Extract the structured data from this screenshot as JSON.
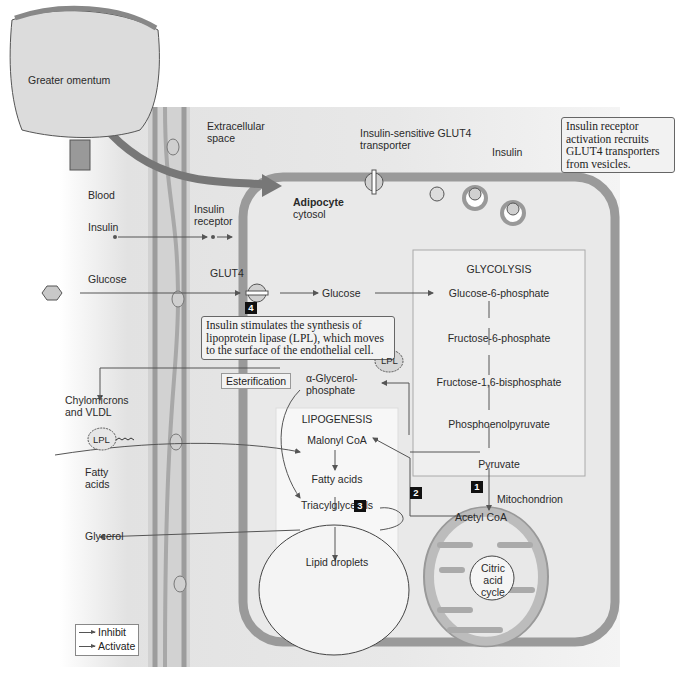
{
  "regions": {
    "organ": "Greater omentum",
    "extracellular": "Extracellular space",
    "blood": "Blood",
    "cell_title": "Adipocyte",
    "cell_subtitle": "cytosol",
    "mitochondrion": "Mitochondrion"
  },
  "blood_side": {
    "insulin": "Insulin",
    "glucose": "Glucose",
    "chylomicrons": "Chylomicrons and VLDL",
    "fatty_acids": "Fatty acids",
    "glycerol": "Glycerol",
    "lpl_outside": "LPL"
  },
  "membrane": {
    "insulin_receptor": "Insulin receptor",
    "glut4": "GLUT4",
    "glut4_sensitive": "Insulin-sensitive GLUT4 transporter",
    "insulin_top": "Insulin",
    "glucose_inside": "Glucose"
  },
  "callouts": {
    "recruit": "Insulin receptor activation recruits GLUT4 transporters from vesicles.",
    "lpl_synthesis": "Insulin stimulates the synthesis of lipoprotein lipase (LPL), which moves to the surface of the endothelial cell.",
    "lpl_inside": "LPL",
    "esterification": "Esterification"
  },
  "glycolysis": {
    "title": "GLYCOLYSIS",
    "steps": [
      "Glucose-6-phosphate",
      "Fructose-6-phosphate",
      "Fructose-1,6-bisphosphate",
      "Phosphoenolpyruvate",
      "Pyruvate"
    ]
  },
  "lipogenesis": {
    "title": "LIPOGENESIS",
    "malonyl": "Malonyl CoA",
    "fatty_acids": "Fatty acids",
    "triacylglycerols": "Triacylglycerols",
    "lipid_droplets": "Lipid droplets",
    "glycerol_phosphate": "α-Glycerol-phosphate"
  },
  "mito": {
    "acetyl_coa": "Acetyl CoA",
    "citric": "Citric acid cycle"
  },
  "step_numbers": [
    "1",
    "2",
    "3",
    "4"
  ],
  "legend": {
    "inhibit": "Inhibit",
    "activate": "Activate"
  },
  "colors": {
    "cell_fill": "#e6e6e6",
    "membrane": "#9a9a9a",
    "arrow": "#555555",
    "box_bg": "#f3f3f3"
  }
}
